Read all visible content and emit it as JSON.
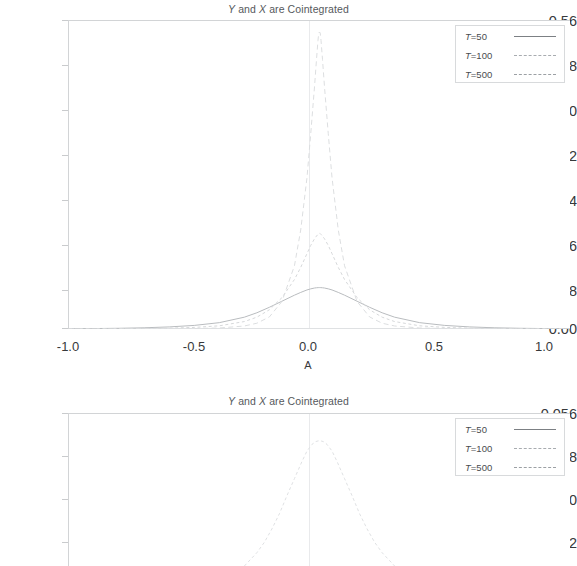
{
  "charts": [
    {
      "id": "top",
      "title_prefix": "Y",
      "title_mid": " and ",
      "title_var2": "X",
      "title_suffix": " are Cointegrated",
      "title_full": "Y and X are Cointegrated",
      "xlabel": "A",
      "ylabel": "",
      "ytick_labels": [
        "0.56",
        "0.48",
        "0.40",
        "0.32",
        "0.24",
        "0.16",
        "0.08",
        "0.00"
      ],
      "xtick_labels": [
        "-1.0",
        "-0.5",
        "0.0",
        "0.5",
        "1.0"
      ],
      "legend": [
        {
          "label_var": "T",
          "label_rest": "=50",
          "label_full": "T=50",
          "style": "solid"
        },
        {
          "label_var": "T",
          "label_rest": "=100",
          "label_full": "T=100",
          "style": "dot"
        },
        {
          "label_var": "T",
          "label_rest": "=500",
          "label_full": "T=500",
          "style": "dash"
        }
      ]
    },
    {
      "id": "bottom",
      "title_prefix": "Y",
      "title_mid": " and ",
      "title_var2": "X",
      "title_suffix": " are Cointegrated",
      "title_full": "Y and X are Cointegrated",
      "xlabel": "",
      "ylabel": "",
      "ytick_labels": [
        "0.056",
        "0.048",
        "0.040",
        "0.032"
      ],
      "xtick_labels": [],
      "legend": [
        {
          "label_var": "T",
          "label_rest": "=50",
          "label_full": "T=50",
          "style": "solid"
        },
        {
          "label_var": "T",
          "label_rest": "=100",
          "label_full": "T=100",
          "style": "dot"
        },
        {
          "label_var": "T",
          "label_rest": "=500",
          "label_full": "T=500",
          "style": "dash"
        }
      ]
    }
  ],
  "chart_data": [
    {
      "type": "line",
      "title": "Y and X are Cointegrated",
      "xlabel": "A",
      "ylabel": "",
      "xlim": [
        -1.0,
        1.0
      ],
      "ylim": [
        0.0,
        0.56
      ],
      "xticks": [
        -1.0,
        -0.5,
        0.0,
        0.5,
        1.0
      ],
      "yticks": [
        0.0,
        0.08,
        0.16,
        0.24,
        0.32,
        0.4,
        0.48,
        0.56
      ],
      "grid": "vertical-at-zero",
      "legend_position": "top-right",
      "description": "Density of estimator A; three sample sizes. Peak sharpens and grows as T increases.",
      "x": [
        -1.0,
        -0.9,
        -0.8,
        -0.7,
        -0.6,
        -0.5,
        -0.4,
        -0.3,
        -0.25,
        -0.2,
        -0.15,
        -0.1,
        -0.075,
        -0.05,
        -0.035,
        -0.02,
        -0.012,
        -0.006,
        -0.003,
        0.0,
        0.003,
        0.006,
        0.012,
        0.02,
        0.035,
        0.05,
        0.075,
        0.1,
        0.15,
        0.2,
        0.25,
        0.3,
        0.4,
        0.5,
        0.6,
        0.7,
        0.8,
        0.9,
        1.0
      ],
      "series": [
        {
          "name": "T=50",
          "style": "solid",
          "values": [
            0.0005,
            0.0008,
            0.0013,
            0.0022,
            0.0038,
            0.0065,
            0.0115,
            0.0215,
            0.0295,
            0.0395,
            0.0505,
            0.0615,
            0.0665,
            0.071,
            0.073,
            0.0745,
            0.075,
            0.0752,
            0.0753,
            0.0753,
            0.0753,
            0.0752,
            0.075,
            0.0745,
            0.073,
            0.071,
            0.0665,
            0.0615,
            0.0505,
            0.0395,
            0.0295,
            0.0215,
            0.0115,
            0.0065,
            0.0038,
            0.0022,
            0.0013,
            0.0008,
            0.0005
          ]
        },
        {
          "name": "T=100",
          "style": "dot",
          "values": [
            0.0002,
            0.0003,
            0.0005,
            0.0009,
            0.0016,
            0.0029,
            0.0058,
            0.0135,
            0.0215,
            0.035,
            0.057,
            0.09,
            0.112,
            0.137,
            0.152,
            0.164,
            0.169,
            0.172,
            0.1735,
            0.174,
            0.1735,
            0.172,
            0.169,
            0.164,
            0.152,
            0.137,
            0.112,
            0.09,
            0.057,
            0.035,
            0.0215,
            0.0135,
            0.0058,
            0.0029,
            0.0016,
            0.0009,
            0.0005,
            0.0003,
            0.0002
          ]
        },
        {
          "name": "T=500",
          "style": "dash",
          "values": [
            5e-05,
            8e-05,
            0.00013,
            0.00022,
            0.0004,
            0.0008,
            0.0018,
            0.0055,
            0.0105,
            0.022,
            0.05,
            0.115,
            0.18,
            0.275,
            0.355,
            0.44,
            0.49,
            0.525,
            0.538,
            0.54,
            0.538,
            0.525,
            0.49,
            0.44,
            0.355,
            0.275,
            0.18,
            0.115,
            0.05,
            0.022,
            0.0105,
            0.0055,
            0.0018,
            0.0008,
            0.0004,
            0.00022,
            0.00013,
            8e-05,
            5e-05
          ]
        }
      ]
    },
    {
      "type": "line",
      "title": "Y and X are Cointegrated",
      "xlabel": "",
      "ylabel": "",
      "xlim": [
        -1.0,
        1.0
      ],
      "ylim": [
        0.024,
        0.056
      ],
      "xticks": [],
      "yticks": [
        0.032,
        0.04,
        0.048,
        0.056
      ],
      "grid": "vertical-at-zero",
      "legend_position": "top-right",
      "description": "Vertically magnified view of the same densities; only the T=100 curve's shoulder region is visible in the cropped window.",
      "x": [
        -0.3,
        -0.25,
        -0.22,
        -0.19,
        -0.16,
        -0.13,
        -0.1,
        -0.07,
        -0.05,
        -0.03,
        -0.015,
        0.0,
        0.015,
        0.03,
        0.05,
        0.07,
        0.1,
        0.13,
        0.16,
        0.19,
        0.22,
        0.25,
        0.3
      ],
      "series": [
        {
          "name": "T=100",
          "style": "dot",
          "values": [
            0.024,
            0.0268,
            0.029,
            0.0318,
            0.035,
            0.0388,
            0.0424,
            0.046,
            0.0482,
            0.0496,
            0.0502,
            0.0504,
            0.0502,
            0.0496,
            0.0482,
            0.046,
            0.0424,
            0.0388,
            0.035,
            0.0318,
            0.029,
            0.0268,
            0.024
          ]
        }
      ]
    }
  ]
}
